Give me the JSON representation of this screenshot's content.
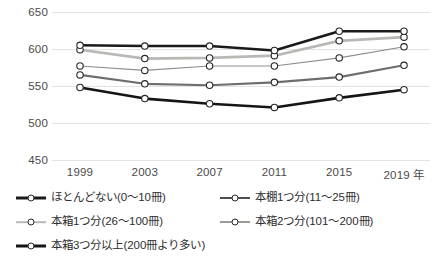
{
  "chart_data": {
    "type": "line",
    "title": "",
    "xlabel": "",
    "ylabel": "",
    "x": [
      "1999",
      "2003",
      "2007",
      "2011",
      "2015",
      "2019"
    ],
    "xtick_labels": [
      "1999",
      "2003",
      "2007",
      "2011",
      "2015",
      "2019 年"
    ],
    "ylim": [
      450,
      650
    ],
    "ytick_labels": [
      "650",
      "600",
      "550",
      "500",
      "450"
    ],
    "yticks": [
      650,
      600,
      550,
      500,
      450
    ],
    "grid": true,
    "legend_position": "bottom",
    "series": [
      {
        "name": "ほとんどない(0〜10冊)",
        "color": "#1a1a1a",
        "width": 2.6,
        "values": [
          605,
          604,
          604,
          598,
          624,
          624
        ]
      },
      {
        "name": "本棚1つ分(11〜25冊)",
        "color": "#b8b8b4",
        "width": 2.6,
        "values": [
          599,
          587,
          588,
          591,
          611,
          616
        ]
      },
      {
        "name": "本箱1つ分(26〜100冊)",
        "color": "#8e8e8a",
        "width": 1.2,
        "values": [
          577,
          571,
          577,
          577,
          588,
          603
        ]
      },
      {
        "name": "本箱2つ分(101〜200冊)",
        "color": "#6e6e6a",
        "width": 2.2,
        "values": [
          565,
          553,
          551,
          555,
          562,
          578
        ]
      },
      {
        "name": "本箱3つ分以上(200冊より多い)",
        "color": "#151515",
        "width": 2.6,
        "values": [
          548,
          533,
          526,
          521,
          534,
          545
        ]
      }
    ]
  },
  "legend": {
    "items": [
      {
        "label": "ほとんどない(0〜10冊)",
        "color": "#1a1a1a",
        "width": 3,
        "col": 0,
        "row": 0
      },
      {
        "label": "本棚1つ分(11〜25冊)",
        "color": "#4f4f4f",
        "width": 2,
        "col": 1,
        "row": 0
      },
      {
        "label": "本箱1つ分(26〜100冊)",
        "color": "#b9b9b5",
        "width": 1.6,
        "col": 0,
        "row": 1
      },
      {
        "label": "本箱2つ分(101〜200冊)",
        "color": "#9a9a96",
        "width": 2,
        "col": 1,
        "row": 1
      },
      {
        "label": "本箱3つ分以上(200冊より多い)",
        "color": "#151515",
        "width": 3,
        "col": 0,
        "row": 2
      }
    ]
  },
  "marker": {
    "fill": "#ffffff",
    "stroke": "#262626"
  }
}
